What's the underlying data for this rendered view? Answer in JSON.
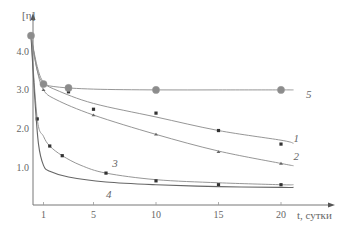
{
  "chart_data": {
    "type": "line",
    "title": "",
    "xlabel": "t, сутки",
    "ylabel": "[η]",
    "xlim": [
      0,
      22
    ],
    "ylim": [
      0,
      4.8
    ],
    "x_ticks": [
      1,
      5,
      10,
      15,
      20
    ],
    "x_tick_labels": [
      "1",
      "5",
      "10",
      "15",
      "20"
    ],
    "y_ticks": [
      1.0,
      2.0,
      3.0,
      4.0
    ],
    "y_tick_labels": [
      "1.0",
      "2.0",
      "3.0",
      "4.0"
    ],
    "grid": false,
    "legend": "inline curve numbers",
    "series": [
      {
        "name": "1",
        "marker": "square",
        "points": [
          [
            0,
            4.4
          ],
          [
            1,
            3.15
          ],
          [
            3,
            2.95
          ],
          [
            5,
            2.5
          ],
          [
            10,
            2.4
          ],
          [
            15,
            1.95
          ],
          [
            20,
            1.6
          ]
        ],
        "curve": [
          [
            0,
            4.4
          ],
          [
            0.5,
            3.6
          ],
          [
            1,
            3.2
          ],
          [
            2,
            3.0
          ],
          [
            5,
            2.65
          ],
          [
            10,
            2.3
          ],
          [
            15,
            1.95
          ],
          [
            20,
            1.7
          ],
          [
            21,
            1.62
          ]
        ],
        "label_pos": [
          21,
          1.75
        ]
      },
      {
        "name": "2",
        "marker": "triangle",
        "points": [
          [
            0,
            4.4
          ],
          [
            1,
            3.0
          ],
          [
            5,
            2.35
          ],
          [
            10,
            1.85
          ],
          [
            15,
            1.4
          ],
          [
            20,
            1.1
          ]
        ],
        "curve": [
          [
            0,
            4.4
          ],
          [
            0.5,
            3.5
          ],
          [
            1,
            3.0
          ],
          [
            2,
            2.75
          ],
          [
            5,
            2.35
          ],
          [
            10,
            1.85
          ],
          [
            15,
            1.42
          ],
          [
            20,
            1.1
          ],
          [
            21,
            1.04
          ]
        ],
        "label_pos": [
          21,
          1.3
        ]
      },
      {
        "name": "3",
        "marker": "square",
        "points": [
          [
            0,
            4.4
          ],
          [
            0.5,
            2.25
          ],
          [
            1.5,
            1.55
          ],
          [
            2.5,
            1.3
          ],
          [
            6,
            0.85
          ],
          [
            10,
            0.65
          ],
          [
            15,
            0.55
          ],
          [
            20,
            0.55
          ]
        ],
        "curve": [
          [
            0,
            4.4
          ],
          [
            0.5,
            2.25
          ],
          [
            1,
            1.8
          ],
          [
            1.5,
            1.55
          ],
          [
            2.5,
            1.3
          ],
          [
            4,
            1.05
          ],
          [
            6,
            0.85
          ],
          [
            10,
            0.68
          ],
          [
            15,
            0.6
          ],
          [
            20,
            0.55
          ],
          [
            21,
            0.55
          ]
        ],
        "label_pos": [
          6.5,
          1.1
        ]
      },
      {
        "name": "4",
        "marker": "none",
        "points": [],
        "curve": [
          [
            0,
            4.4
          ],
          [
            0.3,
            2.8
          ],
          [
            0.6,
            1.6
          ],
          [
            1,
            1.05
          ],
          [
            1.5,
            0.9
          ],
          [
            3,
            0.75
          ],
          [
            6,
            0.62
          ],
          [
            10,
            0.55
          ],
          [
            15,
            0.5
          ],
          [
            20,
            0.48
          ],
          [
            21,
            0.48
          ]
        ],
        "label_pos": [
          6,
          0.3
        ]
      },
      {
        "name": "5",
        "marker": "circle-large",
        "points": [
          [
            0,
            4.4
          ],
          [
            1,
            3.15
          ],
          [
            3,
            3.05
          ],
          [
            10,
            3.0
          ],
          [
            20,
            3.0
          ]
        ],
        "curve": [
          [
            0,
            4.4
          ],
          [
            0.5,
            3.5
          ],
          [
            1,
            3.18
          ],
          [
            2,
            3.08
          ],
          [
            5,
            3.02
          ],
          [
            10,
            3.0
          ],
          [
            15,
            3.0
          ],
          [
            20,
            3.0
          ],
          [
            21,
            3.0
          ]
        ],
        "label_pos": [
          22,
          2.9
        ]
      }
    ]
  }
}
